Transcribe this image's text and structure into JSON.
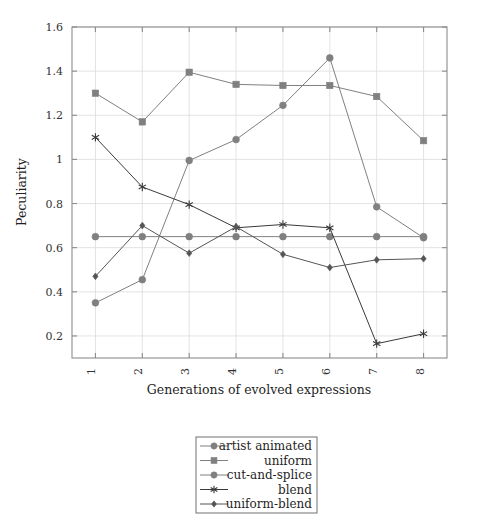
{
  "chart_data": {
    "type": "line",
    "title": "",
    "xlabel": "Generations of evolved expressions",
    "ylabel": "Peculiarity",
    "categories": [
      "1",
      "2",
      "3",
      "4",
      "5",
      "6",
      "7",
      "8"
    ],
    "x": [
      1,
      2,
      3,
      4,
      5,
      6,
      7,
      8
    ],
    "xlim": [
      0.5,
      8.5
    ],
    "ylim": [
      0.1,
      1.6
    ],
    "yticks": [
      "0.2",
      "0.4",
      "0.6",
      "0.8",
      "1",
      "1.2",
      "1.4",
      "1.6"
    ],
    "ytick_values": [
      0.2,
      0.4,
      0.6,
      0.8,
      1.0,
      1.2,
      1.4,
      1.6
    ],
    "grid": true,
    "legend_position": "below-center",
    "xtick_rotation": 90,
    "series": [
      {
        "name": "artist animated",
        "marker": "circle",
        "color": "#808080",
        "values": [
          0.65,
          0.65,
          0.65,
          0.65,
          0.65,
          0.65,
          0.65,
          0.65
        ]
      },
      {
        "name": "uniform",
        "marker": "square",
        "color": "#808080",
        "values": [
          1.3,
          1.17,
          1.395,
          1.34,
          1.335,
          1.335,
          1.285,
          1.085
        ]
      },
      {
        "name": "cut-and-splice",
        "marker": "circle",
        "color": "#808080",
        "values": [
          0.35,
          0.455,
          0.995,
          1.09,
          1.245,
          1.46,
          0.785,
          0.645
        ]
      },
      {
        "name": "blend",
        "marker": "star",
        "color": "#3a3a3a",
        "values": [
          1.1,
          0.875,
          0.795,
          0.69,
          0.705,
          0.69,
          0.165,
          0.21
        ]
      },
      {
        "name": "uniform-blend",
        "marker": "diamond",
        "color": "#555555",
        "values": [
          0.47,
          0.7,
          0.575,
          0.695,
          0.57,
          0.51,
          0.545,
          0.55
        ]
      }
    ]
  },
  "axes": {
    "y_title": "Peculiarity",
    "x_title": "Generations of evolved expressions"
  },
  "legend": {
    "entries": [
      {
        "label": "artist animated",
        "marker": "circle",
        "color": "#808080"
      },
      {
        "label": "uniform",
        "marker": "square",
        "color": "#808080"
      },
      {
        "label": "cut-and-splice",
        "marker": "circle",
        "color": "#808080"
      },
      {
        "label": "blend",
        "marker": "star",
        "color": "#3a3a3a"
      },
      {
        "label": "uniform-blend",
        "marker": "diamond",
        "color": "#555555"
      }
    ]
  },
  "colors": {
    "frame": "#8c8c8c",
    "grid": "#dcdcdc",
    "light_series": "#808080",
    "dark_series": "#3a3a3a",
    "mid_series": "#555555",
    "background": "#ffffff"
  }
}
